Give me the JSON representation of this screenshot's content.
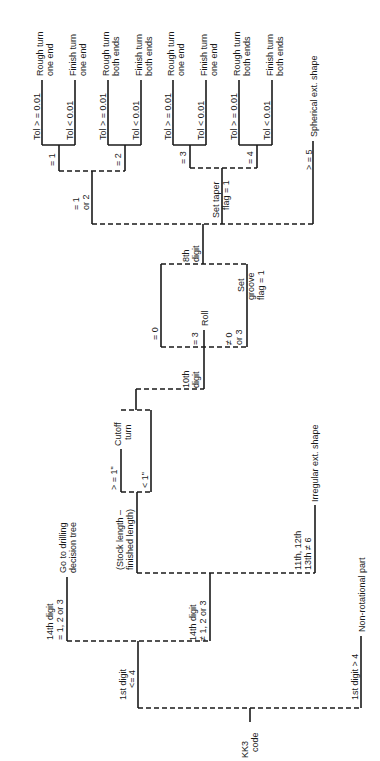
{
  "diagram": {
    "orientation": "rotated-90-ccw",
    "root": {
      "label_line1": "KK3",
      "label_line2": "code"
    },
    "first_digit": {
      "le4": {
        "line1": "1st digit",
        "line2": "<= 4"
      },
      "gt4": {
        "label": "1st digit > 4",
        "outcome": "Non-rotational part"
      }
    },
    "fourteenth_digit": {
      "eq": {
        "line1": "14th digit",
        "line2": "= 1, 2 or 3",
        "outcome_line1": "Go to drilling",
        "outcome_line2": "decision tree"
      },
      "ne": {
        "line1": "14th digit",
        "line2": "≠ 1, 2 or 3"
      }
    },
    "stock_length": {
      "line1": "(Stock length –",
      "line2": "finished length)"
    },
    "cutoff": {
      "ge1": "> = 1\"",
      "lt1": "< 1\"",
      "outcome_line1": "Cutoff",
      "outcome_line2": "turn"
    },
    "irregular": {
      "line1": "11th, 12th",
      "line2": "13th ≠ 6",
      "outcome": "Irregular ext. shape"
    },
    "tenth_digit": {
      "label_line1": "10th",
      "label_line2": "digit",
      "eq0": "= 0",
      "eq3": "= 3",
      "eq3_outcome": "Roll",
      "ne03_line1": "≠ 0",
      "ne03_line2": "or 3",
      "groove_line1": "Set",
      "groove_line2": "groove",
      "groove_line3": "flag = 1"
    },
    "eighth_digit": {
      "label_line1": "8th",
      "label_line2": "digit",
      "eq12_line1": "= 1",
      "eq12_line2": "or 2",
      "taper_line1": "Set taper",
      "taper_line2": "flag = 1",
      "ge5": "> = 5",
      "ge5_outcome": "Spherical ext. shape"
    },
    "branches": [
      {
        "cond": "= 1",
        "tol_ge": "Tol > = 0.01",
        "tol_lt": "Tol < 0.01",
        "ge_line1": "Rough turn",
        "ge_line2": "one end",
        "lt_line1": "Finish turn",
        "lt_line2": "one end"
      },
      {
        "cond": "= 2",
        "tol_ge": "Tol > = 0.01",
        "tol_lt": "Tol < 0.01",
        "ge_line1": "Rough turn",
        "ge_line2": "both ends",
        "lt_line1": "Finish turn",
        "lt_line2": "both ends"
      },
      {
        "cond": "= 3",
        "tol_ge": "Tol > = 0.01",
        "tol_lt": "Tol < 0.01",
        "ge_line1": "Rough turn",
        "ge_line2": "one end",
        "lt_line1": "Finish turn",
        "lt_line2": "one end"
      },
      {
        "cond": "= 4",
        "tol_ge": "Tol > = 0.01",
        "tol_lt": "Tol < 0.01",
        "ge_line1": "Rough turn",
        "ge_line2": "both ends",
        "lt_line1": "Finish turn",
        "lt_line2": "both ends"
      }
    ]
  }
}
